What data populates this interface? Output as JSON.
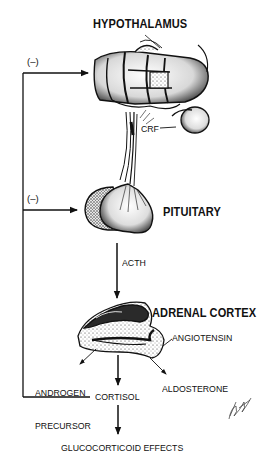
{
  "diagram": {
    "nodes": {
      "hypothalamus": "HYPOTHALAMUS",
      "pituitary": "PITUITARY",
      "adrenal_cortex": "ADRENAL CORTEX"
    },
    "signals": {
      "crf": "CRF",
      "acth": "ACTH",
      "angiotensin": "ANGIOTENSIN",
      "androgen_precursor_line1": "ANDROGEN",
      "androgen_precursor_line2": "PRECURSOR",
      "aldosterone": "ALDOSTERONE",
      "cortisol": "CORTISOL",
      "glucocorticoid_effects": "GLUCOCORTICOID EFFECTS"
    },
    "feedback": {
      "to_hypothalamus": "(–)",
      "to_pituitary": "(–)"
    },
    "edges": [
      {
        "from": "HYPOTHALAMUS",
        "to": "PITUITARY",
        "label": "CRF"
      },
      {
        "from": "PITUITARY",
        "to": "ADRENAL CORTEX",
        "label": "ACTH"
      },
      {
        "from": "ANGIOTENSIN",
        "to": "ADRENAL CORTEX",
        "label": ""
      },
      {
        "from": "ADRENAL CORTEX",
        "to": "ANDROGEN PRECURSOR",
        "label": ""
      },
      {
        "from": "ADRENAL CORTEX",
        "to": "CORTISOL",
        "label": ""
      },
      {
        "from": "ADRENAL CORTEX",
        "to": "ALDOSTERONE",
        "label": ""
      },
      {
        "from": "CORTISOL",
        "to": "GLUCOCORTICOID EFFECTS",
        "label": ""
      },
      {
        "from": "CORTISOL",
        "to": "HYPOTHALAMUS",
        "label": "(–)"
      },
      {
        "from": "CORTISOL",
        "to": "PITUITARY",
        "label": "(–)"
      }
    ],
    "colors": {
      "ink": "#111111",
      "background": "#ffffff",
      "stipple": "#555555"
    }
  }
}
